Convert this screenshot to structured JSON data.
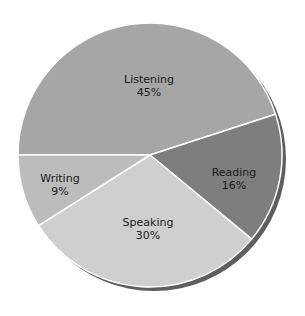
{
  "chart_data": {
    "type": "pie",
    "title": "",
    "categories": [
      "Listening",
      "Reading",
      "Speaking",
      "Writing"
    ],
    "values": [
      45,
      16,
      30,
      9
    ],
    "labels": [
      "45%",
      "16%",
      "30%",
      "9%"
    ],
    "colors": [
      "#a6a6a6",
      "#7e7e7e",
      "#cfcfcf",
      "#bcbcbc"
    ],
    "shadow_color": "#5e5e5e",
    "start_angle_deg": 180,
    "direction": "clockwise",
    "legend": "none",
    "slices": [
      {
        "name": "Listening",
        "pct": "45%",
        "value": 45
      },
      {
        "name": "Reading",
        "pct": "16%",
        "value": 16
      },
      {
        "name": "Speaking",
        "pct": "30%",
        "value": 30
      },
      {
        "name": "Writing",
        "pct": "9%",
        "value": 9
      }
    ]
  }
}
